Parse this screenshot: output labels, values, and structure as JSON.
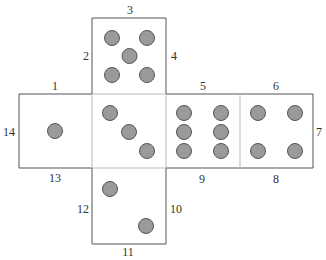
{
  "diagram": {
    "title": "",
    "faces": [
      {
        "id": "top",
        "pips": 5
      },
      {
        "id": "left",
        "pips": 1
      },
      {
        "id": "center",
        "pips": 3
      },
      {
        "id": "right1",
        "pips": 6
      },
      {
        "id": "right2",
        "pips": 4
      },
      {
        "id": "bottom",
        "pips": 2
      }
    ],
    "edge_labels": [
      "1",
      "2",
      "3",
      "4",
      "5",
      "6",
      "7",
      "8",
      "9",
      "10",
      "11",
      "12",
      "13",
      "14"
    ],
    "colors": {
      "pip_fill": "#9a9a9a",
      "pip_stroke": "#555555",
      "edge": "#555555",
      "fold": "#bbbbbb"
    }
  }
}
